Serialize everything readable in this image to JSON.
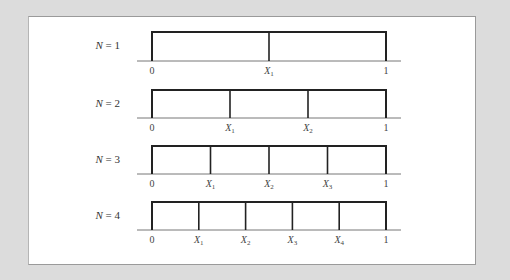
{
  "figure": {
    "colors": {
      "background": "#dcdcdc",
      "panel": "#ffffff",
      "line": "#222222",
      "text": "#444444"
    },
    "rows": [
      {
        "label": "N = 1",
        "n": 1,
        "ticks": [
          "0",
          "X1",
          "1"
        ]
      },
      {
        "label": "N = 2",
        "n": 2,
        "ticks": [
          "0",
          "X1",
          "X2",
          "1"
        ]
      },
      {
        "label": "N = 3",
        "n": 3,
        "ticks": [
          "0",
          "X1",
          "X2",
          "X3",
          "1"
        ]
      },
      {
        "label": "N = 4",
        "n": 4,
        "ticks": [
          "0",
          "X1",
          "X2",
          "X3",
          "X4",
          "1"
        ]
      }
    ]
  }
}
